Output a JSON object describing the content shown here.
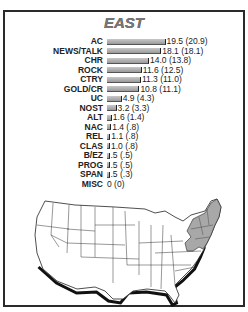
{
  "chart_data": {
    "type": "bar",
    "orientation": "horizontal",
    "title": "EAST",
    "categories": [
      "AC",
      "NEWS/TALK",
      "CHR",
      "ROCK",
      "CTRY",
      "GOLD/CR",
      "UC",
      "NOST",
      "ALT",
      "NAC",
      "REL",
      "CLAS",
      "B/EZ",
      "PROG",
      "SPAN",
      "MISC"
    ],
    "values": [
      19.5,
      18.1,
      14.0,
      11.6,
      11.3,
      10.8,
      4.9,
      3.2,
      1.6,
      1.4,
      1.1,
      1.0,
      0.5,
      0.5,
      0.5,
      0
    ],
    "previous_values": [
      20.9,
      18.1,
      13.8,
      12.5,
      11.0,
      11.1,
      4.3,
      3.3,
      1.4,
      0.8,
      0.8,
      0.8,
      0.5,
      0.5,
      0.3,
      0
    ],
    "labels": [
      "19.5 (20.9)",
      "18.1 (18.1)",
      "14.0 (13.8)",
      "11.6 (12.5)",
      "11.3 (11.0)",
      "10.8 (11.1)",
      "4.9 (4.3)",
      "3.2 (3.3)",
      "1.6 (1.4)",
      "1.4 (.8)",
      "1.1 (.8)",
      "1.0 (.8)",
      ".5 (.5)",
      ".5 (.5)",
      ".5 (.3)",
      "0 (0)"
    ],
    "xlabel": "",
    "ylabel": "",
    "grid": false,
    "legend": "none",
    "annotation": "US map with eastern region (Northeast / Mid-Atlantic states) shaded"
  },
  "colors": {
    "bar": "#b0b0b0",
    "map_highlight": "#a8a8a8",
    "border": "#2a2a2a"
  }
}
